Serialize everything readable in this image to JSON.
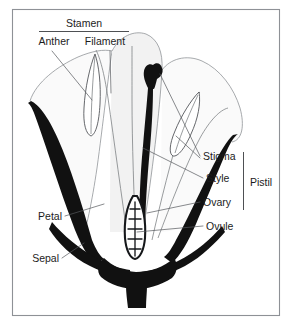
{
  "figure": {
    "background_color": "#ffffff",
    "frame_color": "#8e9196",
    "ink_color": "#111111",
    "label_color": "#1c1c1c",
    "leader_color": "#55585c"
  },
  "labels": {
    "stamen": "Stamen",
    "anther": "Anther",
    "filament": "Filament",
    "stigma": "Stigma",
    "style": "Style",
    "ovary": "Ovary",
    "ovule": "Ovule",
    "pistil": "Pistil",
    "petal": "Petal",
    "sepal": "Sepal"
  },
  "groupings": {
    "stamen_members": [
      "Anther",
      "Filament"
    ],
    "pistil_members": [
      "Stigma",
      "Style",
      "Ovary"
    ],
    "stamen_bracket": "horizontal-underline",
    "pistil_bracket": "vertical-line"
  },
  "parts": {
    "ovule_count": 5,
    "stamen_count": 3,
    "petal_count": 3,
    "sepal_count": 2
  }
}
